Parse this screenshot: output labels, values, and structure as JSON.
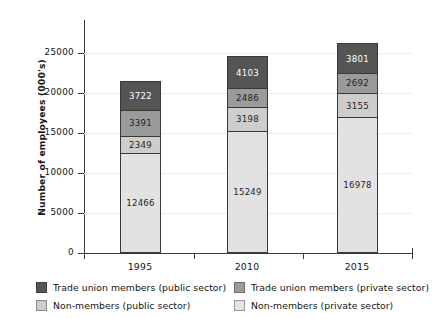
{
  "chart_data": {
    "type": "bar",
    "stacked": true,
    "title": "",
    "subtitle": "",
    "xlabel": "",
    "ylabel": "Number of employees (000's)",
    "categories": [
      "1995",
      "2010",
      "2015"
    ],
    "ylim": [
      0,
      27500
    ],
    "yticks": [
      0,
      5000,
      10000,
      15000,
      20000,
      25000
    ],
    "ytick_labels": [
      "0",
      "5000",
      "10000",
      "15000",
      "20000",
      "25000"
    ],
    "grid": true,
    "legend_position": "bottom",
    "series": [
      {
        "name": "Non-members (private sector)",
        "key": "nm-private",
        "color": "#e2e2e2",
        "values": [
          12466,
          15249,
          16978
        ],
        "labels": [
          "12466",
          "15249",
          "16978"
        ]
      },
      {
        "name": "Non-members (public sector)",
        "key": "nm-public",
        "color": "#cdcdcd",
        "values": [
          2349,
          3198,
          3155
        ],
        "labels": [
          "2349",
          "3198",
          "3155"
        ]
      },
      {
        "name": "Trade union members (private sector)",
        "key": "tu-private",
        "color": "#9a9a9a",
        "values": [
          3391,
          2486,
          2692
        ],
        "labels": [
          "3391",
          "2486",
          "2692"
        ]
      },
      {
        "name": "Trade union members (public sector)",
        "key": "tu-public",
        "color": "#555555",
        "values": [
          3722,
          4103,
          3801
        ],
        "labels": [
          "3722",
          "4103",
          "3801"
        ]
      }
    ],
    "totals": [
      21928,
      25036,
      26626
    ]
  },
  "legend": {
    "items": [
      {
        "label": "Trade union members (public sector)",
        "key": "tu-public"
      },
      {
        "label": "Trade union members (private sector)",
        "key": "tu-private"
      },
      {
        "label": "Non-members (public sector)",
        "key": "nm-public"
      },
      {
        "label": "Non-members (private sector)",
        "key": "nm-private"
      }
    ]
  }
}
